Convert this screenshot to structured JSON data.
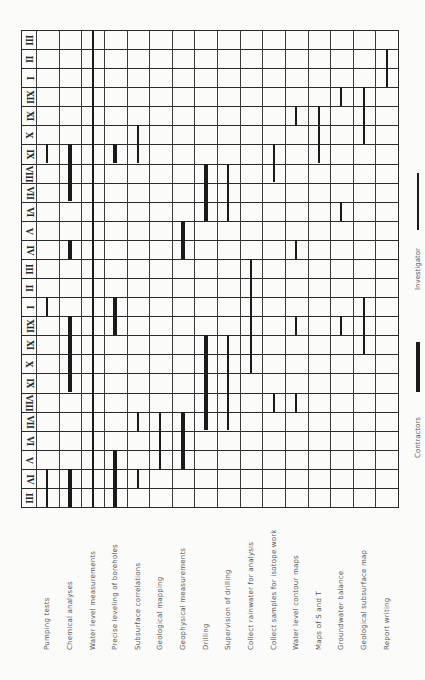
{
  "chart_data": {
    "type": "gantt",
    "title": "",
    "orientation": "rotated 90 degrees; months run along vertical axis (bottom = first month), activities along horizontal axis",
    "months_top_to_bottom": [
      "III",
      "II",
      "I",
      "XII",
      "XI",
      "X",
      "IX",
      "VIII",
      "VII",
      "VI",
      "V",
      "IV",
      "III",
      "II",
      "I",
      "XII",
      "XI",
      "X",
      "IX",
      "VIII",
      "VII",
      "VI",
      "V",
      "IV",
      "III"
    ],
    "activities": [
      "Pumping tests",
      "Chemical analyses",
      "Water level measurements",
      "Precise leveling of boreholes",
      "Subsurface correlations",
      "Geological mapping",
      "Geophysical measurements",
      "Drilling",
      "Supervision of drilling",
      "Collect rainwater for analysis",
      "Collect samples for isotope work",
      "Water level contour maps",
      "Maps of S and T",
      "Groundwater balance",
      "Geological subsurface map",
      "Report writing"
    ],
    "legend": [
      {
        "label": "Contractors",
        "style": "thick"
      },
      {
        "label": "Investigator",
        "style": "thin"
      }
    ],
    "bars": [
      {
        "activity": 0,
        "style": "thin",
        "rows_from_top": [
          6
        ]
      },
      {
        "activity": 0,
        "style": "thin",
        "rows_from_top": [
          14
        ]
      },
      {
        "activity": 0,
        "style": "thin",
        "rows_from_top": [
          23,
          24
        ]
      },
      {
        "activity": 1,
        "style": "thick",
        "rows_from_top": [
          6,
          7,
          8
        ]
      },
      {
        "activity": 1,
        "style": "thick",
        "rows_from_top": [
          11
        ]
      },
      {
        "activity": 1,
        "style": "thick",
        "rows_from_top": [
          15,
          16,
          17,
          18
        ]
      },
      {
        "activity": 1,
        "style": "thick",
        "rows_from_top": [
          23,
          24
        ]
      },
      {
        "activity": 2,
        "style": "thin",
        "rows_from_top": [
          0,
          1,
          2,
          3,
          4,
          5,
          6,
          7,
          8,
          9,
          10,
          11,
          12,
          13,
          14,
          15,
          16,
          17,
          18,
          19,
          20,
          21,
          22,
          23,
          24
        ]
      },
      {
        "activity": 3,
        "style": "thick",
        "rows_from_top": [
          6
        ]
      },
      {
        "activity": 3,
        "style": "thick",
        "rows_from_top": [
          14,
          15
        ]
      },
      {
        "activity": 3,
        "style": "thick",
        "rows_from_top": [
          22,
          23,
          24
        ]
      },
      {
        "activity": 4,
        "style": "thin",
        "rows_from_top": [
          5,
          6
        ]
      },
      {
        "activity": 4,
        "style": "thin",
        "rows_from_top": [
          20
        ]
      },
      {
        "activity": 4,
        "style": "thin",
        "rows_from_top": [
          23
        ]
      },
      {
        "activity": 5,
        "style": "thin",
        "rows_from_top": [
          20,
          21,
          22
        ]
      },
      {
        "activity": 6,
        "style": "thick",
        "rows_from_top": [
          10,
          11
        ]
      },
      {
        "activity": 6,
        "style": "thick",
        "rows_from_top": [
          20,
          21,
          22
        ]
      },
      {
        "activity": 7,
        "style": "thick",
        "rows_from_top": [
          7,
          8,
          9
        ]
      },
      {
        "activity": 7,
        "style": "thick",
        "rows_from_top": [
          16,
          17,
          18,
          19,
          20
        ]
      },
      {
        "activity": 8,
        "style": "thin",
        "rows_from_top": [
          7,
          8,
          9
        ]
      },
      {
        "activity": 8,
        "style": "thin",
        "rows_from_top": [
          16,
          17,
          18,
          19,
          20
        ]
      },
      {
        "activity": 9,
        "style": "thin",
        "rows_from_top": [
          12,
          13,
          14,
          15,
          16,
          17
        ]
      },
      {
        "activity": 10,
        "style": "thin",
        "rows_from_top": [
          6,
          7
        ]
      },
      {
        "activity": 10,
        "style": "thin",
        "rows_from_top": [
          19
        ]
      },
      {
        "activity": 11,
        "style": "thin",
        "rows_from_top": [
          4
        ]
      },
      {
        "activity": 11,
        "style": "thin",
        "rows_from_top": [
          11
        ]
      },
      {
        "activity": 11,
        "style": "thin",
        "rows_from_top": [
          15
        ]
      },
      {
        "activity": 11,
        "style": "thin",
        "rows_from_top": [
          19
        ]
      },
      {
        "activity": 12,
        "style": "thin",
        "rows_from_top": [
          4,
          5,
          6
        ]
      },
      {
        "activity": 13,
        "style": "thin",
        "rows_from_top": [
          3
        ]
      },
      {
        "activity": 13,
        "style": "thin",
        "rows_from_top": [
          9
        ]
      },
      {
        "activity": 13,
        "style": "thin",
        "rows_from_top": [
          15
        ]
      },
      {
        "activity": 14,
        "style": "thin",
        "rows_from_top": [
          3,
          4,
          5
        ]
      },
      {
        "activity": 14,
        "style": "thin",
        "rows_from_top": [
          14,
          15,
          16
        ]
      },
      {
        "activity": 15,
        "style": "thin",
        "rows_from_top": [
          1,
          2
        ]
      }
    ]
  },
  "legend": {
    "contractors_label": "Contractors",
    "investigator_label": "Investigator"
  }
}
